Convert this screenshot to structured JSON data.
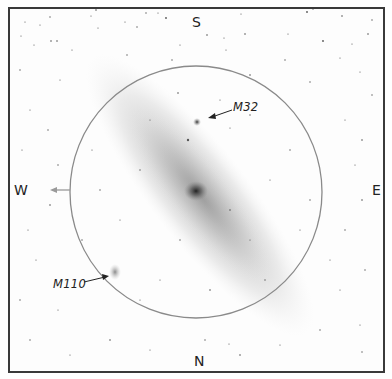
{
  "chart": {
    "directions": {
      "top": "S",
      "bottom": "N",
      "left": "W",
      "right": "E"
    },
    "objects": [
      {
        "id": "m32",
        "label": "M32"
      },
      {
        "id": "m110",
        "label": "M110"
      }
    ],
    "colors": {
      "frame": "#3a3a3a",
      "circle": "#8a8a8a",
      "west_arrow": "#9a9a9a",
      "galaxy_core": "#2a2a2a",
      "stars": "#555555"
    }
  }
}
